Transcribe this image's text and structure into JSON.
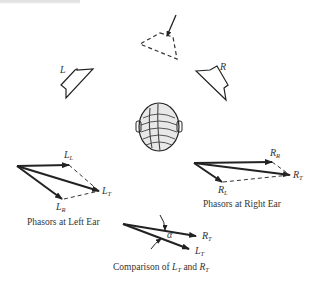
{
  "figure": {
    "speakers": {
      "left_label": "L",
      "right_label": "R"
    },
    "left_ear": {
      "caption": "Phasors at Left Ear",
      "labels": {
        "LL": {
          "main": "L",
          "sub": "L"
        },
        "LR": {
          "main": "L",
          "sub": "R"
        },
        "LT": {
          "main": "L",
          "sub": "T"
        }
      }
    },
    "right_ear": {
      "caption": "Phasors at Right Ear",
      "labels": {
        "RR": {
          "main": "R",
          "sub": "R"
        },
        "RL": {
          "main": "R",
          "sub": "L"
        },
        "RT": {
          "main": "R",
          "sub": "T"
        }
      }
    },
    "comparison": {
      "caption_prefix": "Comparison of ",
      "caption_a_main": "L",
      "caption_a_sub": "T",
      "caption_mid": " and ",
      "caption_b_main": "R",
      "caption_b_sub": "T",
      "angle_label": "α",
      "labels": {
        "RT": {
          "main": "R",
          "sub": "T"
        },
        "LT": {
          "main": "L",
          "sub": "T"
        }
      }
    }
  }
}
